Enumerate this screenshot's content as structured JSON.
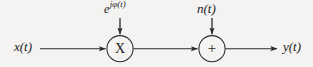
{
  "diagram": {
    "type": "signal-flow-block-diagram",
    "background_color": "#f4f3f1",
    "line_color": "#2b2b2b",
    "text_color": "#1a1a1a",
    "input": {
      "label": "x(t)",
      "name": "input-signal"
    },
    "output": {
      "label": "y(t)",
      "name": "output-signal"
    },
    "nodes": [
      {
        "id": "multiplier",
        "glyph": "X",
        "shape": "circle",
        "operation": "multiply",
        "center_x": 120,
        "center_y": 49,
        "radius": 13
      },
      {
        "id": "adder",
        "glyph": "+",
        "shape": "circle",
        "operation": "add",
        "center_x": 212,
        "center_y": 49,
        "radius": 13
      }
    ],
    "injections": [
      {
        "id": "phase-rotation",
        "base": "e",
        "exponent": "jφ(t)",
        "target": "multiplier"
      },
      {
        "id": "noise",
        "label": "n(t)",
        "target": "adder"
      }
    ],
    "equation": "y(t) = x(t)e^{jφ(t)} + n(t)"
  }
}
